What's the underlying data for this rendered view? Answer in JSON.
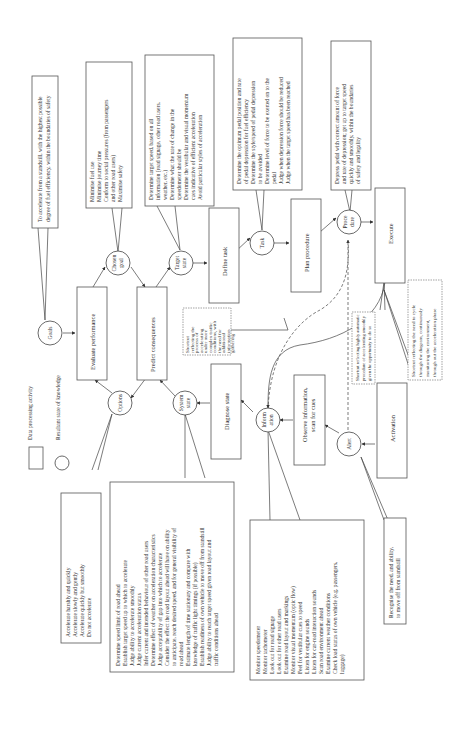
{
  "legend": {
    "box_label": "Data processing activity",
    "circle_label": "Resultant state of knowledge"
  },
  "activities": {
    "activation": "Activation",
    "observe": "Observe information, scan for cues",
    "diagnose": "Diagnose state",
    "predict": "Predict consequences",
    "evaluate": "Evaluate performance",
    "define_task": "Define task",
    "plan_procedure": "Plan procedure",
    "execute": "Execute"
  },
  "states": {
    "alert": "Alert",
    "information": [
      "Inform",
      "ation"
    ],
    "system_state": [
      "System",
      "state"
    ],
    "options": "Options",
    "goals": "Goals",
    "chosen_goal": [
      "Chosen",
      "goal"
    ],
    "target_state": [
      "Target",
      "state"
    ],
    "task": "Task",
    "procedure": [
      "Proce",
      "dure"
    ]
  },
  "callouts": {
    "goals": [
      "To accelerate from a standstill, with the highest possible",
      "degree of fuel efficiency, within the boundaries of safety"
    ],
    "chosen_goal": [
      "Minimise fuel use",
      "Minimise journey time",
      "Conform to social pressures (from passengers",
      "and other road users)",
      "Maximise safety"
    ],
    "target_state": [
      "Determine target speed, based on all",
      "information (road signage, other road users,",
      "weather, etc.)",
      "Determine what the rate of change in the",
      "speedometer should be",
      "Determine the vestibular and visual momentum",
      "cues indicative of efficient acceleration",
      "Avoid particular styles of acceleration"
    ],
    "task": [
      "Determine the optimum pedal position and rate",
      "of pedal depression for fuel efficiency",
      "Determine the style/speed of pedal depression",
      "to be avoided",
      "Determine level of force to be exerted on to the",
      "pedal",
      "Judge when depression force should be reduced",
      "Judge when the target speed has been reached"
    ],
    "procedure": [
      "Depress pedal with correct amount of force",
      "and rate of depression; get up to target speed",
      "quickly and smoothly, within the boundaries",
      "of safety and legality"
    ],
    "options": [
      "Accelerate harshly and quickly",
      "Accelerate slowly and gently",
      "Accelerate quickly but smoothly",
      "Do not accelerate"
    ],
    "system_state": [
      "Determine speed limit of road ahead",
      "Establish target speed up to which to accelerate",
      "Judge ability to accelerate smoothly",
      "Judge current acceleration status",
      "Infer current and intended behaviour of other road users",
      "Determine effect of weather on acceleration characteristics",
      "Judge acceptability of gap into which to accelerate",
      "Consider the effect the road layout ahead will have on ability",
      "to anticipate, reach desired speed, and for general visibility of",
      "road ahead",
      "Estimate length of time stationary and compare with",
      "knowledge of traffic light timings (if possible)",
      "Establish readiness of own vehicle to move off from standstill",
      "Judge ability to reach target speed given road layout and",
      "traffic conditions ahead"
    ],
    "information": [
      "Monitor speedometer",
      "Monitor tachometer",
      "Look out for road signage",
      "Look out for other road users",
      "Examine road layout and markings",
      "Monitor visual momentum (optic flow)",
      "Feel for vestibular cues to speed",
      "Listen for engine sounds",
      "Listen for car-road interaction sounds",
      "Scan road environment ahead",
      "Examine current weather conditions",
      "Check load status of own vehicle (e.g. passengers,",
      "luggage)"
    ],
    "alert": [
      "Recognise the need, and ability,",
      "to move off from standstill"
    ],
    "shortcut_complex": [
      "Shortcut",
      "reflecting the",
      "process of",
      "accelerating",
      "under more",
      "complex traffic",
      "conditions, with",
      "the need for",
      "additional",
      "information",
      "gathering"
    ],
    "shortcut_automatic": [
      "Shortcut reflecting highly automatic",
      "procedure of accelerating smoothly",
      "given the opportunity to do so"
    ],
    "shortcut_cycle": [
      "Shortcut reflecting the need to cycle",
      "through the diagram, continuously",
      "monitoring the environment,",
      "through out the acceleration phase"
    ]
  }
}
